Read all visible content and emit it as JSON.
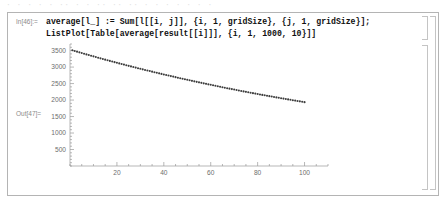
{
  "app": {
    "name": "Mathematica Notebook",
    "ghost_text": "· · ·   · ·   ·· · ·   ·· ·· ·· ·    ·   ·    ·  ·   · ·"
  },
  "input_cell": {
    "label": "In[46]:=",
    "line1": "average[l_] := Sum[l[[i, j]], {i, 1, gridSize}, {j, 1, gridSize}];",
    "line2": "ListPlot[Table[average[result[[i]]], {i, 1, 1000, 10}]]"
  },
  "output_cell": {
    "label": "Out[47]="
  },
  "brackets": {
    "input_bracket": "cell-bracket",
    "output_bracket": "cell-bracket",
    "group_bracket": "cell-group-bracket"
  },
  "chart_data": {
    "type": "scatter",
    "title": "",
    "xlabel": "",
    "ylabel": "",
    "xlim": [
      0,
      110
    ],
    "ylim": [
      0,
      3700
    ],
    "grid": false,
    "legend": null,
    "point_color": "#3c3c3c",
    "axis_color": "#9a9a9a",
    "xticks": [
      20,
      40,
      60,
      80,
      100
    ],
    "yticks": [
      500,
      1000,
      1500,
      2000,
      2500,
      3000,
      3500
    ],
    "xtick_labels": [
      "20",
      "40",
      "60",
      "80",
      "100"
    ],
    "ytick_labels": [
      "500",
      "1000",
      "1500",
      "2000",
      "2500",
      "3000",
      "3500"
    ],
    "x": [
      1,
      2,
      3,
      4,
      5,
      6,
      7,
      8,
      9,
      10,
      11,
      12,
      13,
      14,
      15,
      16,
      17,
      18,
      19,
      20,
      21,
      22,
      23,
      24,
      25,
      26,
      27,
      28,
      29,
      30,
      31,
      32,
      33,
      34,
      35,
      36,
      37,
      38,
      39,
      40,
      41,
      42,
      43,
      44,
      45,
      46,
      47,
      48,
      49,
      50,
      51,
      52,
      53,
      54,
      55,
      56,
      57,
      58,
      59,
      60,
      61,
      62,
      63,
      64,
      65,
      66,
      67,
      68,
      69,
      70,
      71,
      72,
      73,
      74,
      75,
      76,
      77,
      78,
      79,
      80,
      81,
      82,
      83,
      84,
      85,
      86,
      87,
      88,
      89,
      90,
      91,
      92,
      93,
      94,
      95,
      96,
      97,
      98,
      99,
      100
    ],
    "y": [
      3510,
      3489,
      3468,
      3447,
      3426,
      3406,
      3385,
      3365,
      3345,
      3325,
      3305,
      3285,
      3265,
      3246,
      3226,
      3207,
      3188,
      3169,
      3150,
      3131,
      3112,
      3094,
      3075,
      3057,
      3038,
      3020,
      3002,
      2984,
      2966,
      2949,
      2931,
      2913,
      2896,
      2879,
      2861,
      2844,
      2827,
      2810,
      2793,
      2777,
      2760,
      2743,
      2727,
      2711,
      2694,
      2678,
      2662,
      2646,
      2630,
      2615,
      2599,
      2583,
      2568,
      2552,
      2537,
      2522,
      2507,
      2492,
      2477,
      2462,
      2447,
      2432,
      2418,
      2403,
      2389,
      2374,
      2360,
      2346,
      2332,
      2318,
      2304,
      2290,
      2276,
      2263,
      2249,
      2236,
      2222,
      2209,
      2196,
      2183,
      2170,
      2157,
      2144,
      2131,
      2118,
      2106,
      2093,
      2081,
      2068,
      2056,
      2044,
      2032,
      2020,
      2008,
      1996,
      1984,
      1972,
      1960,
      1949,
      1937
    ]
  }
}
